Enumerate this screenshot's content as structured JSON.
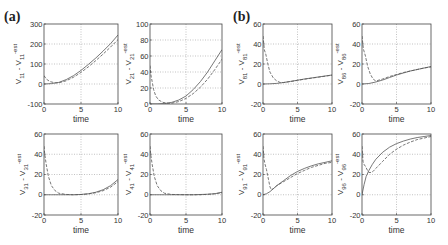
{
  "figure": {
    "panel_labels": [
      {
        "text": "(a)",
        "x": 4,
        "y": 9
      },
      {
        "text": "(b)",
        "x": 233,
        "y": 9
      }
    ],
    "line_color": "#555555",
    "grid_color": "#9a9a9a"
  },
  "chart_data": [
    {
      "type": "line",
      "panel": "a",
      "position": "top-left",
      "frame": [
        44,
        24,
        118,
        104
      ],
      "ylabel": "V11 - V11-est",
      "ylabel_main": "V",
      "ylabel_sub": "11",
      "ylabel_mid": " - V",
      "ylabel_sub2": "11",
      "ylabel_sup": "-est",
      "xlabel": "time",
      "xlim": [
        0,
        10
      ],
      "ylim": [
        -100,
        300
      ],
      "xticks": [
        0,
        5,
        10
      ],
      "yticks": [
        -100,
        0,
        100,
        200,
        300
      ],
      "grid": true,
      "series": [
        {
          "name": "solid",
          "style": "solid",
          "x": [
            0,
            1,
            2,
            3,
            4,
            5,
            6,
            7,
            8,
            9,
            10
          ],
          "y": [
            0,
            2,
            8,
            22,
            42,
            68,
            98,
            130,
            165,
            202,
            245
          ]
        },
        {
          "name": "dashed",
          "style": "dashed",
          "x": [
            0,
            0.3,
            0.8,
            1.5,
            2,
            3,
            4,
            5,
            6,
            7,
            8,
            9,
            10
          ],
          "y": [
            42,
            25,
            12,
            6,
            6,
            16,
            34,
            58,
            86,
            117,
            150,
            185,
            222
          ]
        }
      ]
    },
    {
      "type": "line",
      "panel": "a",
      "position": "top-right",
      "frame": [
        150,
        24,
        222,
        104
      ],
      "ylabel": "V21 - V21-est",
      "ylabel_main": "V",
      "ylabel_sub": "21",
      "ylabel_mid": " - V",
      "ylabel_sub2": "21",
      "ylabel_sup": "-est",
      "xlabel": "time",
      "xlim": [
        0,
        10
      ],
      "ylim": [
        0,
        100
      ],
      "xticks": [
        0,
        5,
        10
      ],
      "yticks": [
        0,
        20,
        40,
        60,
        80,
        100
      ],
      "grid": true,
      "series": [
        {
          "name": "solid",
          "style": "solid",
          "x": [
            0,
            1,
            2,
            3,
            4,
            5,
            6,
            7,
            8,
            9,
            10
          ],
          "y": [
            0,
            0,
            0.5,
            2,
            5,
            10,
            18,
            28,
            40,
            54,
            68
          ]
        },
        {
          "name": "dashed",
          "style": "dashed",
          "x": [
            0,
            0.15,
            0.3,
            0.5,
            0.8,
            1.2,
            1.8,
            2.5,
            3,
            4,
            5,
            6,
            7,
            8,
            9,
            10
          ],
          "y": [
            48,
            35,
            28,
            18,
            10,
            5,
            2,
            1,
            1,
            3,
            7,
            13,
            21,
            31,
            43,
            56
          ]
        }
      ]
    },
    {
      "type": "line",
      "panel": "b",
      "position": "top-left",
      "frame": [
        263,
        24,
        332,
        104
      ],
      "ylabel": "V81 - V81-est",
      "ylabel_main": "V",
      "ylabel_sub": "81",
      "ylabel_mid": " - V",
      "ylabel_sub2": "81",
      "ylabel_sup": "-est",
      "xlabel": "time",
      "xlim": [
        0,
        10
      ],
      "ylim": [
        -20,
        60
      ],
      "xticks": [
        0,
        5,
        10
      ],
      "yticks": [
        -20,
        0,
        20,
        40,
        60
      ],
      "grid": true,
      "series": [
        {
          "name": "solid",
          "style": "solid",
          "x": [
            0,
            1,
            2,
            3,
            4,
            5,
            6,
            7,
            8,
            9,
            10
          ],
          "y": [
            0,
            0.2,
            0.6,
            1.5,
            2.6,
            3.8,
            5,
            6,
            7,
            8,
            9
          ]
        },
        {
          "name": "dashed",
          "style": "dashed",
          "x": [
            0,
            0.2,
            0.4,
            0.7,
            1,
            1.5,
            2,
            2.5,
            3,
            4,
            5,
            6,
            7,
            8,
            9,
            10
          ],
          "y": [
            48,
            34,
            30,
            20,
            12,
            6,
            3,
            1.5,
            1.5,
            2.5,
            3.6,
            4.8,
            5.8,
            6.8,
            7.8,
            8.8
          ]
        }
      ]
    },
    {
      "type": "line",
      "panel": "b",
      "position": "top-right",
      "frame": [
        362,
        24,
        431,
        104
      ],
      "ylabel": "V86 - V86-est",
      "ylabel_main": "V",
      "ylabel_sub": "86",
      "ylabel_mid": " - V",
      "ylabel_sub2": "86",
      "ylabel_sup": "-est",
      "xlabel": "time",
      "xlim": [
        0,
        10
      ],
      "ylim": [
        -20,
        60
      ],
      "xticks": [
        0,
        5,
        10
      ],
      "yticks": [
        -20,
        0,
        20,
        40,
        60
      ],
      "grid": true,
      "series": [
        {
          "name": "solid",
          "style": "solid",
          "x": [
            0,
            1,
            2,
            3,
            4,
            5,
            6,
            7,
            8,
            9,
            10
          ],
          "y": [
            0,
            0.5,
            2,
            4,
            6.5,
            9,
            11,
            13,
            14.5,
            16,
            17.5
          ]
        },
        {
          "name": "dashed",
          "style": "dashed",
          "x": [
            0,
            0.2,
            0.5,
            0.8,
            1.2,
            1.6,
            2,
            3,
            4,
            5,
            6,
            7,
            8,
            9,
            10
          ],
          "y": [
            48,
            35,
            28,
            18,
            10,
            5,
            3,
            5,
            7.5,
            9.5,
            11.5,
            13,
            14.5,
            16,
            17
          ]
        }
      ]
    },
    {
      "type": "line",
      "panel": "a",
      "position": "bottom-left",
      "frame": [
        44,
        134,
        118,
        215
      ],
      "ylabel": "V31 - V31-est",
      "ylabel_main": "V",
      "ylabel_sub": "31",
      "ylabel_mid": " - V",
      "ylabel_sub2": "31",
      "ylabel_sup": "-est",
      "xlabel": "time",
      "xlim": [
        0,
        10
      ],
      "ylim": [
        -20,
        60
      ],
      "xticks": [
        0,
        5,
        10
      ],
      "yticks": [
        -20,
        0,
        20,
        40,
        60
      ],
      "grid": true,
      "series": [
        {
          "name": "solid",
          "style": "solid",
          "x": [
            0,
            1,
            2,
            3,
            4,
            5,
            6,
            7,
            8,
            9,
            10
          ],
          "y": [
            0,
            0,
            0,
            0,
            0,
            0.3,
            1,
            2.5,
            5,
            9,
            15
          ]
        },
        {
          "name": "dashed",
          "style": "dashed",
          "x": [
            0,
            0.1,
            0.3,
            0.6,
            1,
            1.5,
            2,
            3,
            4,
            5,
            6,
            7,
            8,
            9,
            10
          ],
          "y": [
            48,
            40,
            30,
            18,
            9,
            4,
            1.5,
            0.3,
            0,
            0.2,
            0.8,
            2,
            4,
            7.5,
            13
          ]
        }
      ]
    },
    {
      "type": "line",
      "panel": "a",
      "position": "bottom-right",
      "frame": [
        150,
        134,
        222,
        215
      ],
      "ylabel": "V41 - V41-est",
      "ylabel_main": "V",
      "ylabel_sub": "41",
      "ylabel_mid": " - V",
      "ylabel_sub2": "41",
      "ylabel_sup": "-est",
      "xlabel": "time",
      "xlim": [
        0,
        10
      ],
      "ylim": [
        -20,
        60
      ],
      "xticks": [
        0,
        5,
        10
      ],
      "yticks": [
        -20,
        0,
        20,
        40,
        60
      ],
      "grid": true,
      "series": [
        {
          "name": "solid",
          "style": "solid",
          "x": [
            0,
            2,
            4,
            6,
            8,
            9,
            10
          ],
          "y": [
            0,
            0,
            0,
            0,
            0.5,
            1,
            2.5
          ]
        },
        {
          "name": "dashed",
          "style": "dashed",
          "x": [
            0,
            0.1,
            0.3,
            0.6,
            1,
            1.5,
            2,
            3,
            5,
            7,
            8,
            9,
            10
          ],
          "y": [
            48,
            40,
            30,
            18,
            9,
            4,
            1.5,
            0.3,
            0,
            0,
            0.4,
            1,
            2
          ]
        }
      ]
    },
    {
      "type": "line",
      "panel": "b",
      "position": "bottom-left",
      "frame": [
        263,
        134,
        332,
        215
      ],
      "ylabel": "V91 - V91-est",
      "ylabel_main": "V",
      "ylabel_sub": "91",
      "ylabel_mid": " - V",
      "ylabel_sub2": "91",
      "ylabel_sup": "-est",
      "xlabel": "time",
      "xlim": [
        0,
        10
      ],
      "ylim": [
        -20,
        60
      ],
      "xticks": [
        0,
        5,
        10
      ],
      "yticks": [
        -20,
        0,
        20,
        40,
        60
      ],
      "grid": true,
      "series": [
        {
          "name": "solid",
          "style": "solid",
          "x": [
            0,
            0.5,
            1,
            1.5,
            2,
            3,
            4,
            5,
            6,
            7,
            8,
            9,
            10
          ],
          "y": [
            0,
            1,
            3,
            6,
            9,
            14,
            19,
            23,
            26,
            28.5,
            30.5,
            32,
            33.5
          ]
        },
        {
          "name": "dashed",
          "style": "dashed",
          "x": [
            0,
            0.15,
            0.3,
            0.5,
            0.8,
            1,
            1.2,
            1.5,
            2,
            3,
            4,
            5,
            6,
            7,
            8,
            9,
            10
          ],
          "y": [
            48,
            35,
            30,
            25,
            15,
            8,
            5,
            6,
            9,
            13,
            17,
            21,
            24,
            27,
            29,
            31,
            32
          ]
        }
      ]
    },
    {
      "type": "line",
      "panel": "b",
      "position": "bottom-right",
      "frame": [
        362,
        134,
        431,
        215
      ],
      "ylabel": "V96 - V96-est",
      "ylabel_main": "V",
      "ylabel_sub": "96",
      "ylabel_mid": " - V",
      "ylabel_sub2": "96",
      "ylabel_sup": "-est",
      "xlabel": "time",
      "xlim": [
        0,
        10
      ],
      "ylim": [
        -20,
        60
      ],
      "xticks": [
        0,
        5,
        10
      ],
      "yticks": [
        -20,
        0,
        20,
        40,
        60
      ],
      "grid": true,
      "series": [
        {
          "name": "solid",
          "style": "solid",
          "x": [
            0,
            0.3,
            0.6,
            1,
            1.5,
            2,
            3,
            4,
            5,
            6,
            7,
            8,
            9,
            10
          ],
          "y": [
            0,
            10,
            18,
            24,
            30,
            35,
            42,
            47,
            50.5,
            53,
            55,
            56.5,
            57.5,
            58.5
          ]
        },
        {
          "name": "dashed",
          "style": "dashed",
          "x": [
            0,
            0.15,
            0.3,
            0.5,
            0.8,
            1,
            1.3,
            1.6,
            2,
            3,
            4,
            5,
            6,
            7,
            8,
            9,
            10
          ],
          "y": [
            48,
            33,
            30,
            28,
            24,
            22,
            22,
            23,
            26,
            33,
            40,
            45,
            49,
            52,
            54.5,
            56,
            57.5
          ]
        }
      ]
    }
  ]
}
